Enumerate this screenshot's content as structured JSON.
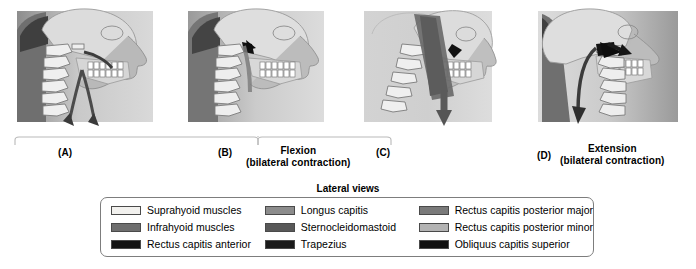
{
  "figure": {
    "lateral_views_title": "Lateral views",
    "panels": [
      {
        "letter": "(A)",
        "title": "",
        "subtitle": ""
      },
      {
        "letter": "(B)",
        "title": "Flexion",
        "subtitle": "(bilateral contraction)"
      },
      {
        "letter": "(C)",
        "title": "",
        "subtitle": ""
      },
      {
        "letter": "(D)",
        "title": "Extension",
        "subtitle": "(bilateral contraction)"
      }
    ],
    "legend": {
      "columns": [
        {
          "items": [
            {
              "label": "Suprahyoid muscles",
              "color": "#f2f1ee"
            },
            {
              "label": "Infrahyoid muscles",
              "color": "#6e6e6e"
            },
            {
              "label": "Rectus capitis anterior",
              "color": "#141414"
            }
          ]
        },
        {
          "items": [
            {
              "label": "Longus capitis",
              "color": "#8c8c8c"
            },
            {
              "label": "Sternocleidomastoid",
              "color": "#585858"
            },
            {
              "label": "Trapezius",
              "color": "#1b1b1b"
            }
          ]
        },
        {
          "items": [
            {
              "label": "Rectus capitis posterior major",
              "color": "#7a7a7a"
            },
            {
              "label": "Rectus capitis posterior minor",
              "color": "#b3b3b3"
            },
            {
              "label": "Obliquus capitis superior",
              "color": "#101010"
            }
          ]
        }
      ]
    }
  }
}
